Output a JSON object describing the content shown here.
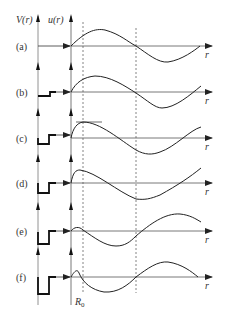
{
  "figure": {
    "y_axis_left_label": "V(r)",
    "y_axis_right_label": "u(r)",
    "x_axis_label": "r",
    "radius_label": "R",
    "radius_subscript": "0",
    "panels": [
      {
        "id": "a",
        "label": "(a)",
        "well_depth": 0,
        "description": "no potential"
      },
      {
        "id": "b",
        "label": "(b)",
        "well_depth": 4,
        "description": "shallow well"
      },
      {
        "id": "c",
        "label": "(c)",
        "well_depth": 9,
        "description": "well with tangent at R0"
      },
      {
        "id": "d",
        "label": "(d)",
        "well_depth": 12,
        "description": "deeper well"
      },
      {
        "id": "e",
        "label": "(e)",
        "well_depth": 16,
        "description": "deeper well"
      },
      {
        "id": "f",
        "label": "(f)",
        "well_depth": 20,
        "description": "deepest well"
      }
    ]
  }
}
